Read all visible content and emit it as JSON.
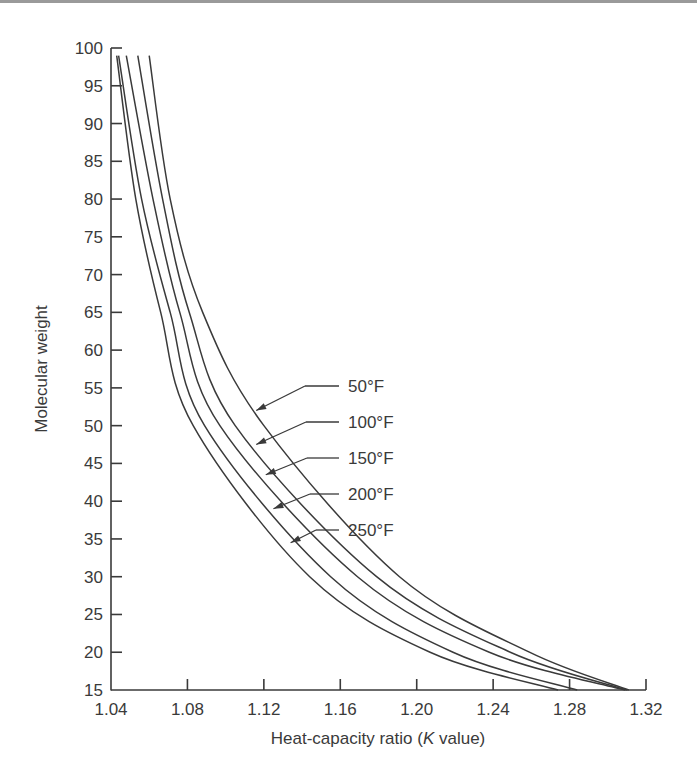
{
  "chart_data": {
    "type": "line",
    "title": "",
    "xlabel": "Heat-capacity ratio (K value)",
    "xlabel_parts": [
      "Heat-capacity ratio (",
      "K",
      " value)"
    ],
    "ylabel": "Molecular weight",
    "xlim": [
      1.04,
      1.32
    ],
    "ylim": [
      15,
      100
    ],
    "x_ticks": [
      "1.04",
      "1.08",
      "1.12",
      "1.16",
      "1.20",
      "1.24",
      "1.28",
      "1.32"
    ],
    "y_ticks": [
      "15",
      "20",
      "25",
      "30",
      "35",
      "40",
      "45",
      "50",
      "55",
      "60",
      "65",
      "70",
      "75",
      "80",
      "85",
      "90",
      "95",
      "100"
    ],
    "grid": false,
    "legend_placement": "annotations with arrows pointing to curves, center",
    "series": [
      {
        "name": "50°F",
        "points": [
          [
            1.06,
            99
          ],
          [
            1.071,
            80
          ],
          [
            1.088,
            65
          ],
          [
            1.12,
            50
          ],
          [
            1.191,
            30
          ],
          [
            1.259,
            20
          ],
          [
            1.311,
            15
          ]
        ]
      },
      {
        "name": "100°F",
        "points": [
          [
            1.054,
            99
          ],
          [
            1.067,
            80
          ],
          [
            1.081,
            65
          ],
          [
            1.105,
            50
          ],
          [
            1.179,
            30
          ],
          [
            1.249,
            20
          ],
          [
            1.31,
            15
          ]
        ]
      },
      {
        "name": "150°F",
        "points": [
          [
            1.048,
            99
          ],
          [
            1.062,
            80
          ],
          [
            1.076,
            65
          ],
          [
            1.097,
            50
          ],
          [
            1.169,
            30
          ],
          [
            1.238,
            20
          ],
          [
            1.309,
            15
          ]
        ]
      },
      {
        "name": "200°F",
        "points": [
          [
            1.044,
            99
          ],
          [
            1.056,
            80
          ],
          [
            1.071,
            65
          ],
          [
            1.089,
            50
          ],
          [
            1.155,
            30
          ],
          [
            1.219,
            20
          ],
          [
            1.284,
            15
          ]
        ]
      },
      {
        "name": "250°F",
        "points": [
          [
            1.043,
            99
          ],
          [
            1.053,
            80
          ],
          [
            1.066,
            65
          ],
          [
            1.083,
            50
          ],
          [
            1.144,
            30
          ],
          [
            1.207,
            20
          ],
          [
            1.274,
            15
          ]
        ]
      }
    ],
    "annotations": [
      {
        "label": "50°F",
        "target_series": "50°F",
        "arrow_tip": [
          1.116,
          52
        ]
      },
      {
        "label": "100°F",
        "target_series": "100°F",
        "arrow_tip": [
          1.116,
          47.5
        ]
      },
      {
        "label": "150°F",
        "target_series": "150°F",
        "arrow_tip": [
          1.121,
          43.5
        ]
      },
      {
        "label": "200°F",
        "target_series": "200°F",
        "arrow_tip": [
          1.125,
          39
        ]
      },
      {
        "label": "250°F",
        "target_series": "250°F",
        "arrow_tip": [
          1.134,
          34.5
        ]
      }
    ]
  }
}
